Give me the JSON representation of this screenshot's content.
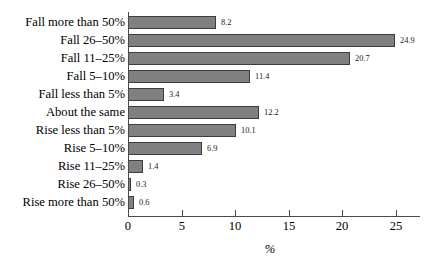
{
  "chart_data": {
    "type": "bar",
    "orientation": "horizontal",
    "title": "",
    "subtitle": "",
    "xlabel": "%",
    "ylabel": "",
    "xlim": [
      0,
      27.3
    ],
    "grid": false,
    "legend": null,
    "bar_color": "#808080",
    "bar_edge_color": "#3d3d3d",
    "xticks": [
      0,
      5,
      10,
      15,
      20,
      25
    ],
    "xtick_labels": [
      "0",
      "5",
      "10",
      "15",
      "20",
      "25"
    ],
    "categories": [
      "Fall more than 50%",
      "Fall 26–50%",
      "Fall 11–25%",
      "Fall 5–10%",
      "Fall less than 5%",
      "About the same",
      "Rise less than 5%",
      "Rise 5–10%",
      "Rise 11–25%",
      "Rise 26–50%",
      "Rise more than 50%"
    ],
    "values": [
      8.2,
      24.9,
      20.7,
      11.4,
      3.4,
      12.2,
      10.1,
      6.9,
      1.4,
      0.3,
      0.6
    ],
    "value_labels": [
      "8.2",
      "24.9",
      "20.7",
      "11.4",
      "3.4",
      "12.2",
      "10.1",
      "6.9",
      "1.4",
      "0.3",
      "0.6"
    ]
  }
}
